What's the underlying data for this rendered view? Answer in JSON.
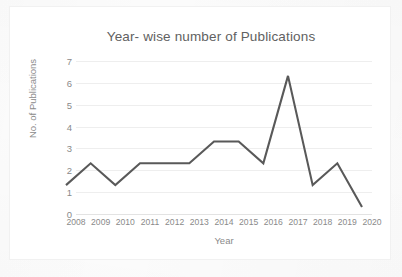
{
  "chart_data": {
    "type": "line",
    "title": "Year- wise number of Publications",
    "xlabel": "Year",
    "ylabel": "No. of Publications",
    "categories": [
      "2008",
      "2009",
      "2010",
      "2011",
      "2012",
      "2013",
      "2014",
      "2015",
      "2016",
      "2017",
      "2018",
      "2019",
      "2020"
    ],
    "values": [
      1,
      2,
      1,
      2,
      2,
      2,
      3,
      3,
      2,
      6,
      1,
      2,
      0
    ],
    "ylim": [
      0,
      7
    ],
    "ytick_labels": [
      "7",
      "6",
      "5",
      "4",
      "3",
      "2",
      "1",
      "0"
    ],
    "ytick_values": [
      7,
      6,
      5,
      4,
      3,
      2,
      1,
      0
    ],
    "grid": true,
    "legend": "none",
    "series_color": "#595959",
    "gridline_color": "#eeeeee",
    "text_color": "#8a8a8a",
    "title_color": "#616161",
    "background_color": "#ffffff"
  }
}
